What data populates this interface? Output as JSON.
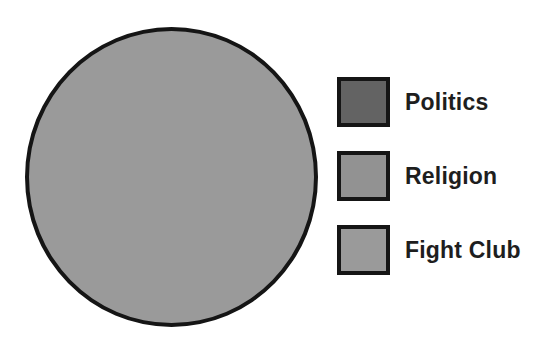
{
  "chart_data": {
    "type": "pie",
    "title": "",
    "legend_position": "right",
    "slices": [
      {
        "label": "Politics",
        "value": 0,
        "color": "#636363"
      },
      {
        "label": "Religion",
        "value": 0,
        "color": "#929292"
      },
      {
        "label": "Fight Club",
        "value": 100,
        "color": "#9a9a9a"
      }
    ],
    "pie_fill_color": "#9a9a9a",
    "outline_color": "#151515",
    "background_color": "#ffffff",
    "annotations": []
  }
}
